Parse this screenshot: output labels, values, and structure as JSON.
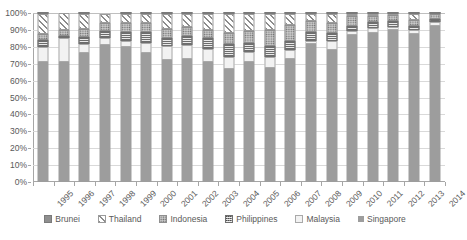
{
  "chart_data": {
    "type": "bar",
    "subtype": "stacked-100-percent",
    "title": "",
    "xlabel": "",
    "ylabel": "",
    "ylim": [
      0,
      100
    ],
    "ytick_labels": [
      "0%",
      "10%",
      "20%",
      "30%",
      "40%",
      "50%",
      "60%",
      "70%",
      "80%",
      "90%",
      "100%"
    ],
    "ytick_values": [
      0,
      10,
      20,
      30,
      40,
      50,
      60,
      70,
      80,
      90,
      100
    ],
    "grid": true,
    "legend_position": "bottom",
    "categories": [
      "1995",
      "1996",
      "1997",
      "1998",
      "1999",
      "2000",
      "2001",
      "2002",
      "2003",
      "2004",
      "2005",
      "2006",
      "2007",
      "2008",
      "2009",
      "2010",
      "2011",
      "2012",
      "2013",
      "2014"
    ],
    "stack_order_bottom_to_top": [
      "Singapore",
      "Malaysia",
      "Philippines",
      "Indonesia",
      "Thailand",
      "Brunei"
    ],
    "series": [
      {
        "name": "Singapore",
        "pattern": "solid-gray",
        "values": [
          71,
          71,
          76.5,
          81,
          80,
          76.5,
          72,
          73,
          71,
          67,
          71,
          67.5,
          73,
          81.5,
          78,
          87,
          88,
          90,
          87.5,
          92.5
        ]
      },
      {
        "name": "Malaysia",
        "pattern": "light-dotted",
        "values": [
          9,
          14,
          5,
          4,
          3.5,
          6,
          8.5,
          8,
          7.5,
          7,
          6,
          6.5,
          5,
          2,
          5.5,
          2.5,
          3,
          2,
          2.5,
          2
        ]
      },
      {
        "name": "Philippines",
        "pattern": "dark-checkered",
        "values": [
          4,
          1.5,
          4.5,
          4.5,
          5.5,
          6,
          5,
          5.5,
          6.5,
          7.5,
          5.5,
          6.5,
          5.5,
          5,
          4.5,
          3,
          3.5,
          3,
          2.5,
          2
        ]
      },
      {
        "name": "Indonesia",
        "pattern": "medium-dotted",
        "values": [
          3.5,
          3.5,
          4.5,
          4.5,
          5,
          5.5,
          5,
          5,
          5,
          6.5,
          7,
          9.5,
          9.5,
          7,
          6,
          5.5,
          4,
          4,
          3.5,
          3
        ]
      },
      {
        "name": "Thailand",
        "pattern": "diagonal-stripes",
        "values": [
          12,
          10,
          9,
          5.5,
          5.5,
          5.5,
          9,
          8,
          9.5,
          11.5,
          10,
          9.5,
          6.5,
          4,
          5.5,
          1.5,
          1,
          0.5,
          3.5,
          0.2
        ]
      },
      {
        "name": "Brunei",
        "pattern": "solid-dark-gray",
        "values": [
          0.5,
          0,
          0.5,
          0,
          0.5,
          0.5,
          0.5,
          0.5,
          0.5,
          0.5,
          0.5,
          0.5,
          0.5,
          0.5,
          0.5,
          0.5,
          0.5,
          0.5,
          0.5,
          0.3
        ]
      }
    ],
    "legend_entries": [
      {
        "label": "Brunei",
        "pattern": "solid-dark-gray"
      },
      {
        "label": "Thailand",
        "pattern": "diagonal-stripes"
      },
      {
        "label": "Indonesia",
        "pattern": "medium-dotted"
      },
      {
        "label": "Philippines",
        "pattern": "dark-checkered"
      },
      {
        "label": "Malaysia",
        "pattern": "light-dotted"
      },
      {
        "label": "Singapore",
        "pattern": "solid-gray"
      }
    ],
    "colors": {
      "singapore": "#9d9d9d",
      "malaysia": "#f2f2f2",
      "philippines": "#8a8a8a",
      "indonesia": "#c9c9c9",
      "thailand": "#ffffff",
      "brunei": "#8f8f8f",
      "gridline": "#d9d9d9",
      "axis": "#a6a6a6",
      "text": "#595959",
      "background": "#ffffff"
    }
  }
}
